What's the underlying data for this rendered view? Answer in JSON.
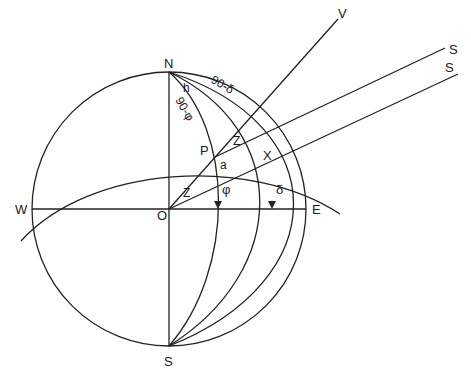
{
  "diagram": {
    "stroke_color": "#222222",
    "background": "#ffffff",
    "labels": {
      "north": "N",
      "south": "S",
      "east": "E",
      "west": "W",
      "origin": "O",
      "pole": "P",
      "star": "X",
      "vertical": "V",
      "sun_ray_1": "S",
      "sun_ray_2": "S",
      "hour_angle": "h",
      "colatitude": "90-φ",
      "codeclination": "90-δ",
      "zenith_angle_1": "Z",
      "zenith_angle_2": "Z",
      "angle_a": "a",
      "latitude": "φ",
      "declination": "δ"
    }
  }
}
